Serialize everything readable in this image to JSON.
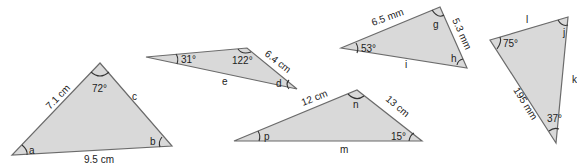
{
  "triangles": [
    {
      "id": "abc",
      "side_left": "7.1 cm",
      "side_right": "c",
      "side_bottom": "9.5 cm",
      "angle_top": "72°",
      "angle_left": "a",
      "angle_right": "b"
    },
    {
      "id": "de",
      "side_right": "6.4 cm",
      "side_bottom": "e",
      "angle_left": "31°",
      "angle_top": "122°",
      "angle_right": "d"
    },
    {
      "id": "ghi",
      "side_top": "6.5 mm",
      "side_right": "5.3 mm",
      "side_bottom": "i",
      "angle_left": "53°",
      "angle_top": "g",
      "angle_right": "h"
    },
    {
      "id": "mnp",
      "side_left": "12 cm",
      "side_right": "13 cm",
      "side_bottom": "m",
      "angle_left": "p",
      "angle_top": "n",
      "angle_right": "15°"
    },
    {
      "id": "jkl",
      "side_top": "l",
      "side_right": "k",
      "side_left": "195 mm",
      "angle_left": "75°",
      "angle_top": "j",
      "angle_bottom": "37°"
    }
  ],
  "colors": {
    "fill": "#d9d9d9",
    "stroke": "#6b6b6b",
    "text": "#222222"
  }
}
